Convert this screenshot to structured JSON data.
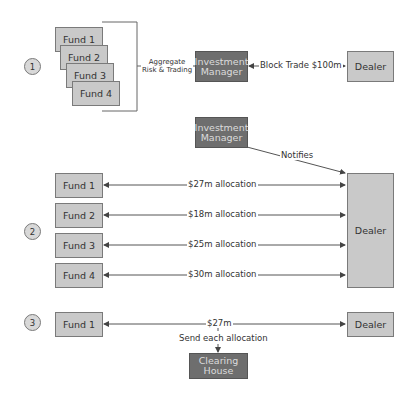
{
  "colors": {
    "light_box": "#c9c9c9",
    "dark_box": "#6e6e6e",
    "line": "#555555",
    "text": "#333333",
    "dark_box_text": "#dcdcdc"
  },
  "step1": {
    "number": "1",
    "funds": [
      "Fund 1",
      "Fund 2",
      "Fund 3",
      "Fund 4"
    ],
    "aggregate_label_line1": "Aggregate",
    "aggregate_label_line2": "Risk & Trading",
    "manager_line1": "Investment",
    "manager_line2": "Manager",
    "trade_label": "Block Trade $100m",
    "dealer": "Dealer"
  },
  "step2": {
    "number": "2",
    "manager_line1": "Investment",
    "manager_line2": "Manager",
    "notifies_label": "Notifies",
    "dealer": "Dealer",
    "allocations": [
      {
        "fund": "Fund 1",
        "label": "$27m allocation"
      },
      {
        "fund": "Fund 2",
        "label": "$18m allocation"
      },
      {
        "fund": "Fund 3",
        "label": "$25m allocation"
      },
      {
        "fund": "Fund 4",
        "label": "$30m allocation"
      }
    ]
  },
  "step3": {
    "number": "3",
    "fund": "Fund 1",
    "amount_label": "$27m",
    "dealer": "Dealer",
    "send_label": "Send each allocation",
    "clearing_line1": "Clearing",
    "clearing_line2": "House"
  }
}
